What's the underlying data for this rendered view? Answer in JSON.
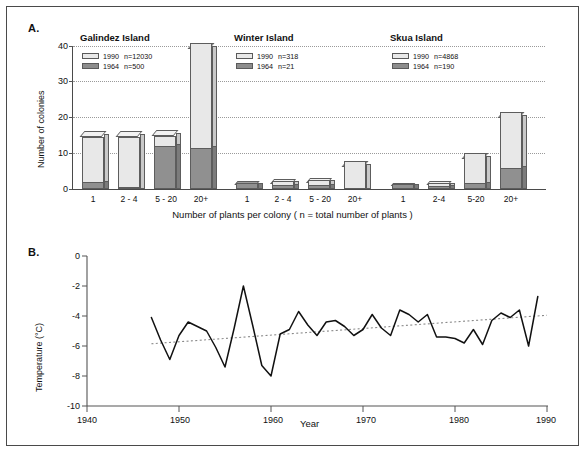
{
  "figure": {
    "background": "#ffffff",
    "border_color": "#4a4a4a"
  },
  "panel_a": {
    "letter": "A.",
    "ylabel": "Number of colonies",
    "xlabel": "Number of plants per colony  ( n = total number of plants )",
    "y_ticks": [
      "0",
      "10",
      "20",
      "30",
      "40"
    ],
    "series_colors": {
      "1990": "#e8e8e8",
      "1964": "#909090"
    },
    "groups": [
      {
        "title": "Galindez Island",
        "legend": [
          {
            "year": "1990",
            "n": "n=12030"
          },
          {
            "year": "1964",
            "n": "n=500"
          }
        ],
        "categories": [
          "1",
          "2 - 4",
          "5 - 20",
          "20+"
        ]
      },
      {
        "title": "Winter Island",
        "legend": [
          {
            "year": "1990",
            "n": "n=318"
          },
          {
            "year": "1964",
            "n": "n=21"
          }
        ],
        "categories": [
          "1",
          "2 - 4",
          "5 - 20",
          "20+"
        ]
      },
      {
        "title": "Skua Island",
        "legend": [
          {
            "year": "1990",
            "n": "n=4868"
          },
          {
            "year": "1964",
            "n": "n=190"
          }
        ],
        "categories": [
          "1",
          "2-4",
          "5-20",
          "20+"
        ]
      }
    ]
  },
  "panel_b": {
    "letter": "B.",
    "ylabel": "Temperature (°C)",
    "xlabel": "Year",
    "y_ticks": [
      "0",
      "-2",
      "-4",
      "-6",
      "-8",
      "-10"
    ],
    "x_ticks": [
      "1940",
      "1950",
      "1960",
      "1970",
      "1980",
      "1990"
    ]
  },
  "chart_data": [
    {
      "type": "bar",
      "title": "Galindez Island",
      "subtitle": "",
      "xlabel": "Number of plants per colony  ( n = total number of plants )",
      "ylabel": "Number of colonies",
      "ylim": [
        0,
        42
      ],
      "grid": true,
      "legend_position": "top-left",
      "stacked": true,
      "categories": [
        "1",
        "2 - 4",
        "5 - 20",
        "20+"
      ],
      "series": [
        {
          "name": "1964 n=500",
          "values": [
            2.0,
            0.3,
            12.0,
            11.5
          ]
        },
        {
          "name": "1990 n=12030",
          "values": [
            14.5,
            14.5,
            15.0,
            41.0
          ]
        }
      ],
      "note": "1990 values are total bar heights; 1964 dark segment drawn in front of the 1990 bar"
    },
    {
      "type": "bar",
      "title": "Winter Island",
      "xlabel": "Number of plants per colony  ( n = total number of plants )",
      "ylabel": "Number of colonies",
      "ylim": [
        0,
        42
      ],
      "grid": true,
      "legend_position": "top-left",
      "stacked": true,
      "categories": [
        "1",
        "2 - 4",
        "5 - 20",
        "20+"
      ],
      "series": [
        {
          "name": "1964 n=21",
          "values": [
            1.4,
            1.0,
            1.2,
            0.0
          ]
        },
        {
          "name": "1990 n=318",
          "values": [
            1.4,
            2.2,
            2.3,
            8.0
          ]
        }
      ]
    },
    {
      "type": "bar",
      "title": "Skua Island",
      "xlabel": "Number of plants per colony  ( n = total number of plants )",
      "ylabel": "Number of colonies",
      "ylim": [
        0,
        42
      ],
      "grid": true,
      "legend_position": "top-left",
      "stacked": true,
      "categories": [
        "1",
        "2-4",
        "5-20",
        "20+"
      ],
      "series": [
        {
          "name": "1964 n=190",
          "values": [
            1.0,
            0.9,
            1.6,
            6.0
          ]
        },
        {
          "name": "1990 n=4868",
          "values": [
            1.0,
            1.6,
            10.0,
            21.5
          ]
        }
      ]
    },
    {
      "type": "line",
      "title": "",
      "xlabel": "Year",
      "ylabel": "Temperature (°C)",
      "xlim": [
        1940,
        1990
      ],
      "ylim": [
        -10,
        0
      ],
      "grid": false,
      "legend_position": "none",
      "series": [
        {
          "name": "Mean annual temperature",
          "x": [
            1947,
            1948,
            1949,
            1950,
            1951,
            1952,
            1953,
            1954,
            1955,
            1956,
            1957,
            1958,
            1959,
            1960,
            1961,
            1962,
            1963,
            1964,
            1965,
            1966,
            1967,
            1968,
            1969,
            1970,
            1971,
            1972,
            1973,
            1974,
            1975,
            1976,
            1977,
            1978,
            1979,
            1980,
            1981,
            1982,
            1983,
            1984,
            1985,
            1986,
            1987,
            1988,
            1989
          ],
          "values": [
            -4.1,
            -5.6,
            -6.9,
            -5.3,
            -4.4,
            -4.7,
            -5.0,
            -6.1,
            -7.4,
            -4.8,
            -2.0,
            -4.6,
            -7.3,
            -8.0,
            -5.2,
            -4.9,
            -3.7,
            -4.6,
            -5.3,
            -4.4,
            -4.3,
            -4.7,
            -5.3,
            -4.9,
            -3.9,
            -4.8,
            -5.3,
            -3.6,
            -3.9,
            -4.4,
            -3.9,
            -5.4,
            -5.4,
            -5.5,
            -5.8,
            -4.9,
            -5.9,
            -4.3,
            -3.8,
            -4.1,
            -3.6,
            -6.0,
            -2.7,
            -3.6
          ]
        },
        {
          "name": "Linear trend",
          "x": [
            1947,
            1990
          ],
          "values": [
            -5.85,
            -3.95
          ],
          "style": "dotted"
        }
      ]
    }
  ]
}
